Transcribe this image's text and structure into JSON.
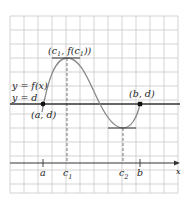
{
  "diagram": {
    "type": "graph",
    "colors": {
      "grid": "#c8c8c8",
      "curve": "#8a8a8a",
      "line_d": "#333333",
      "axis": "#333333",
      "point": "#111111"
    },
    "labels": {
      "curve": "y = f(x)",
      "line": "y = d",
      "point_a": "(a, d)",
      "point_b": "(b, d)",
      "max_point_prefix": "(c",
      "max_point_sub1": "1",
      "max_point_mid": ", f(c",
      "max_point_sub2": "1",
      "max_point_suffix": "))",
      "x_axis": "x"
    },
    "ticks": [
      {
        "label": "a",
        "sub": ""
      },
      {
        "label": "c",
        "sub": "1"
      },
      {
        "label": "c",
        "sub": "2"
      },
      {
        "label": "b",
        "sub": ""
      }
    ]
  }
}
